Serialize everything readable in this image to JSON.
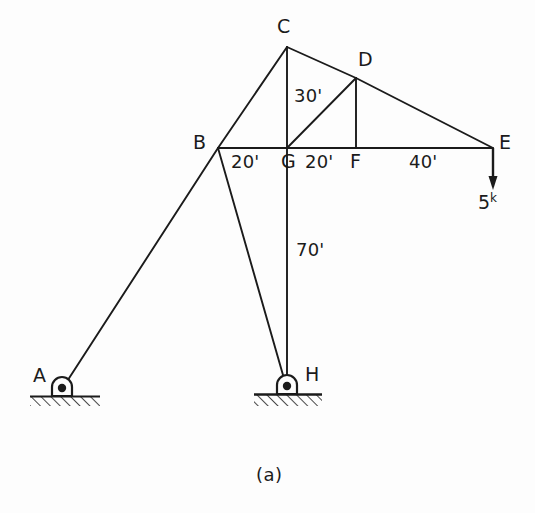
{
  "figure": {
    "caption": "(a)",
    "stroke_color": "#1b1b1b",
    "background_color": "#fdfdfd"
  },
  "nodes": [
    {
      "id": "A",
      "label": "A",
      "x": 62,
      "y": 388,
      "label_x": 33,
      "label_y": 367,
      "support": "pin"
    },
    {
      "id": "B",
      "label": "B",
      "x": 218,
      "y": 148,
      "label_x": 193,
      "label_y": 130,
      "support": "none"
    },
    {
      "id": "C",
      "label": "C",
      "x": 287,
      "y": 47,
      "label_x": 276,
      "label_y": 18,
      "support": "none"
    },
    {
      "id": "D",
      "label": "D",
      "x": 356,
      "y": 78,
      "label_x": 358,
      "label_y": 50,
      "support": "none"
    },
    {
      "id": "E",
      "label": "E",
      "x": 493,
      "y": 148,
      "label_x": 498,
      "label_y": 130,
      "support": "none"
    },
    {
      "id": "F",
      "label": "F",
      "x": 356,
      "y": 148,
      "label_x": 351,
      "label_y": 152,
      "support": "none"
    },
    {
      "id": "G",
      "label": "G",
      "x": 287,
      "y": 148,
      "label_x": 282,
      "label_y": 152,
      "support": "none"
    },
    {
      "id": "H",
      "label": "H",
      "x": 287,
      "y": 385,
      "label_x": 306,
      "label_y": 366,
      "support": "pin"
    }
  ],
  "members": [
    {
      "name": "member-B-C",
      "from": "B",
      "to": "C"
    },
    {
      "name": "member-C-D",
      "from": "C",
      "to": "D"
    },
    {
      "name": "member-D-E",
      "from": "D",
      "to": "E"
    },
    {
      "name": "member-B-E-chord",
      "from": "B",
      "to": "E"
    },
    {
      "name": "member-C-G",
      "from": "C",
      "to": "G"
    },
    {
      "name": "member-G-D",
      "from": "G",
      "to": "D"
    },
    {
      "name": "member-D-F",
      "from": "D",
      "to": "F"
    },
    {
      "name": "member-G-H",
      "from": "G",
      "to": "H"
    },
    {
      "name": "member-B-H",
      "from": "B",
      "to": "H"
    },
    {
      "name": "member-A-B",
      "from": "A",
      "to": "B"
    }
  ],
  "dimensions": [
    {
      "name": "dimension-B-G",
      "text": "20'",
      "x": 230,
      "y": 152
    },
    {
      "name": "dimension-G-F",
      "text": "20'",
      "x": 303,
      "y": 152
    },
    {
      "name": "dimension-F-E",
      "text": "40'",
      "x": 408,
      "y": 152
    },
    {
      "name": "dimension-C-G",
      "text": "30'",
      "x": 293,
      "y": 86
    },
    {
      "name": "dimension-G-H",
      "text": "70'",
      "x": 295,
      "y": 240
    }
  ],
  "load": {
    "name": "point-load-at-E",
    "magnitude": "5",
    "unit": "k",
    "label_x": 479,
    "label_y": 192,
    "arrow_from_x": 493,
    "arrow_from_y": 148,
    "arrow_to_y": 188
  },
  "supports": [
    {
      "id": "A",
      "x": 62,
      "y": 388,
      "ground_y": 397,
      "ground_x1": 33,
      "ground_x2": 98
    },
    {
      "id": "H",
      "x": 287,
      "y": 385,
      "ground_y": 395,
      "ground_x1": 256,
      "ground_x2": 320
    }
  ]
}
